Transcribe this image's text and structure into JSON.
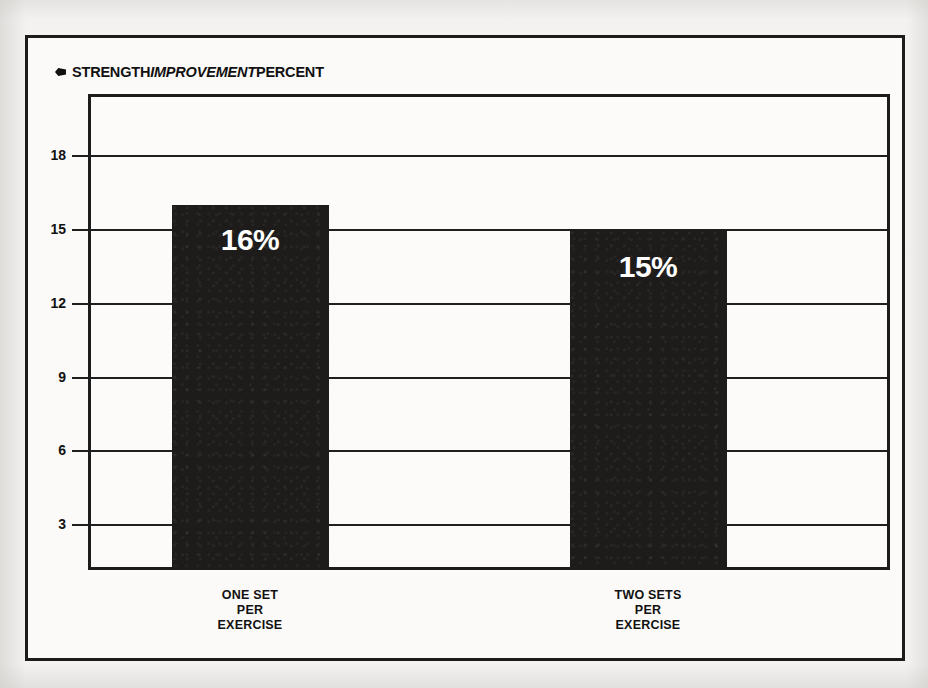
{
  "figure": {
    "background_color": "#f3f2f0",
    "frame_color": "#1c1c1c",
    "bar_color": "#1d1c1b",
    "label_color": "#ffffff",
    "bullet_icon": "diamond-bullet-icon"
  },
  "chart_data": {
    "type": "bar",
    "title_parts": {
      "lead": "STRENGTH",
      "emphasis": "IMPROVEMENT",
      "trail": "PERCENT"
    },
    "xlabel": "",
    "ylabel": "",
    "categories": [
      "ONE SET PER EXERCISE",
      "TWO SETS PER EXERCISE"
    ],
    "category_lines": [
      [
        "ONE SET",
        "PER",
        "EXERCISE"
      ],
      [
        "TWO SETS",
        "PER",
        "EXERCISE"
      ]
    ],
    "values": [
      16,
      15
    ],
    "data_labels": [
      "16%",
      "15%"
    ],
    "ylim": [
      1.3,
      20.4
    ],
    "yticks": [
      3,
      6,
      9,
      12,
      15,
      18
    ],
    "ytick_labels": [
      "3",
      "6",
      "9",
      "12",
      "15",
      "18"
    ],
    "grid": true,
    "grid_axis": "y",
    "legend": false,
    "legend_position": "none"
  }
}
